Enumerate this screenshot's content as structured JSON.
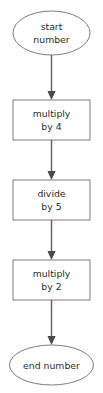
{
  "diagram": {
    "type": "flowchart",
    "orientation": "vertical",
    "canvas": {
      "width": 103,
      "height": 393,
      "background": "#ffffff"
    },
    "colors": {
      "shape_stroke": "#7d7d7d",
      "shape_fill": "#ffffff",
      "text": "#2b2b2b",
      "connector": "#5d5d5d",
      "arrowhead": "#4a4a4a"
    },
    "nodes": [
      {
        "id": "start",
        "shape": "ellipse",
        "label_line1": "start",
        "label_line2": "number",
        "label_full": "start number"
      },
      {
        "id": "step-1",
        "shape": "rectangle",
        "label_line1": "multiply",
        "label_line2": "by 4",
        "label_full": "multiply by 4"
      },
      {
        "id": "step-2",
        "shape": "rectangle",
        "label_line1": "divide",
        "label_line2": "by 5",
        "label_full": "divide by 5"
      },
      {
        "id": "step-3",
        "shape": "rectangle",
        "label_line1": "multiply",
        "label_line2": "by 2",
        "label_full": "multiply by 2"
      },
      {
        "id": "end",
        "shape": "ellipse",
        "label_line1": "end number",
        "label_line2": "",
        "label_full": "end number"
      }
    ],
    "connectors": [
      {
        "id": "start-to-step-1",
        "from": "start",
        "to": "step-1",
        "arrow": "down"
      },
      {
        "id": "step-1-to-step-2",
        "from": "step-1",
        "to": "step-2",
        "arrow": "down"
      },
      {
        "id": "step-2-to-step-3",
        "from": "step-2",
        "to": "step-3",
        "arrow": "down"
      },
      {
        "id": "step-3-to-end",
        "from": "step-3",
        "to": "end",
        "arrow": "down"
      }
    ]
  }
}
